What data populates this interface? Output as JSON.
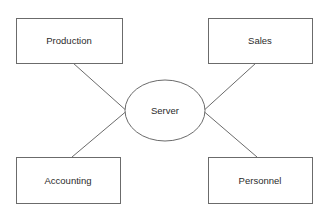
{
  "diagram": {
    "type": "star-network-topology",
    "background_color": "#ffffff",
    "stroke_color": "#6b6b6b",
    "text_color": "#2b2b2b",
    "center_node": {
      "id": "server",
      "label": "Server",
      "shape": "ellipse",
      "cx": 165,
      "cy": 110.5,
      "rx": 40,
      "ry": 30.5
    },
    "nodes": [
      {
        "id": "production",
        "label": "Production",
        "shape": "rectangle",
        "x": 16,
        "y": 18,
        "width": 106,
        "height": 45,
        "label_x": 69,
        "label_y": 41
      },
      {
        "id": "sales",
        "label": "Sales",
        "shape": "rectangle",
        "x": 208,
        "y": 18,
        "width": 104,
        "height": 45,
        "label_x": 260,
        "label_y": 41
      },
      {
        "id": "accounting",
        "label": "Accounting",
        "shape": "rectangle",
        "x": 16,
        "y": 157,
        "width": 104,
        "height": 46,
        "label_x": 68,
        "label_y": 181
      },
      {
        "id": "personnel",
        "label": "Personnel",
        "shape": "rectangle",
        "x": 208,
        "y": 157,
        "width": 104,
        "height": 46,
        "label_x": 260,
        "label_y": 181
      }
    ],
    "connectors": [
      {
        "id": "production-to-server",
        "from": "production",
        "to": "server",
        "x1": 73,
        "y1": 63,
        "x2": 129,
        "y2": 113
      },
      {
        "id": "sales-to-server",
        "from": "sales",
        "to": "server",
        "x1": 256,
        "y1": 63,
        "x2": 201,
        "y2": 113
      },
      {
        "id": "accounting-to-server",
        "from": "accounting",
        "to": "server",
        "x1": 72,
        "y1": 157,
        "x2": 129,
        "y2": 109
      },
      {
        "id": "personnel-to-server",
        "from": "personnel",
        "to": "server",
        "x1": 257,
        "y1": 157,
        "x2": 201,
        "y2": 109
      }
    ]
  }
}
